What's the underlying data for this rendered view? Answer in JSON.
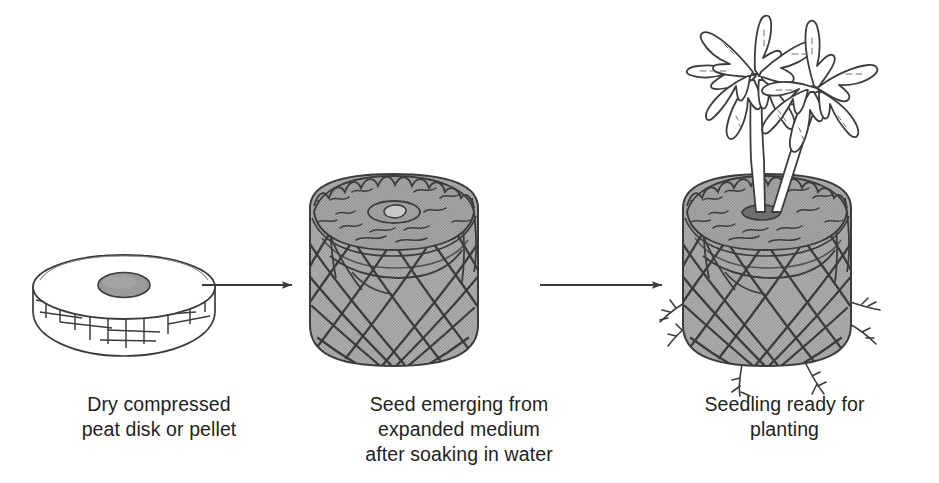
{
  "figure": {
    "background": "#ffffff",
    "ink": "#231f20",
    "medium_fill": "#a9a9a9",
    "disk_fill": "#ffffff",
    "hole_fill": "#9a9a9a"
  },
  "panels": [
    {
      "id": "panel-1",
      "subject": "dry-peat-disk",
      "caption": "Dry compressed\npeat disk or pellet"
    },
    {
      "id": "panel-2",
      "subject": "expanded-peat-pellet-with-seed",
      "caption": "Seed emerging from\nexpanded medium\nafter soaking in water"
    },
    {
      "id": "panel-3",
      "subject": "seedling-in-peat-pellet",
      "caption": "Seedling ready for\nplanting"
    }
  ],
  "arrows": [
    {
      "id": "arrow-1",
      "from": "panel-1",
      "to": "panel-2",
      "direction": "right"
    },
    {
      "id": "arrow-2",
      "from": "panel-2",
      "to": "panel-3",
      "direction": "right"
    }
  ]
}
